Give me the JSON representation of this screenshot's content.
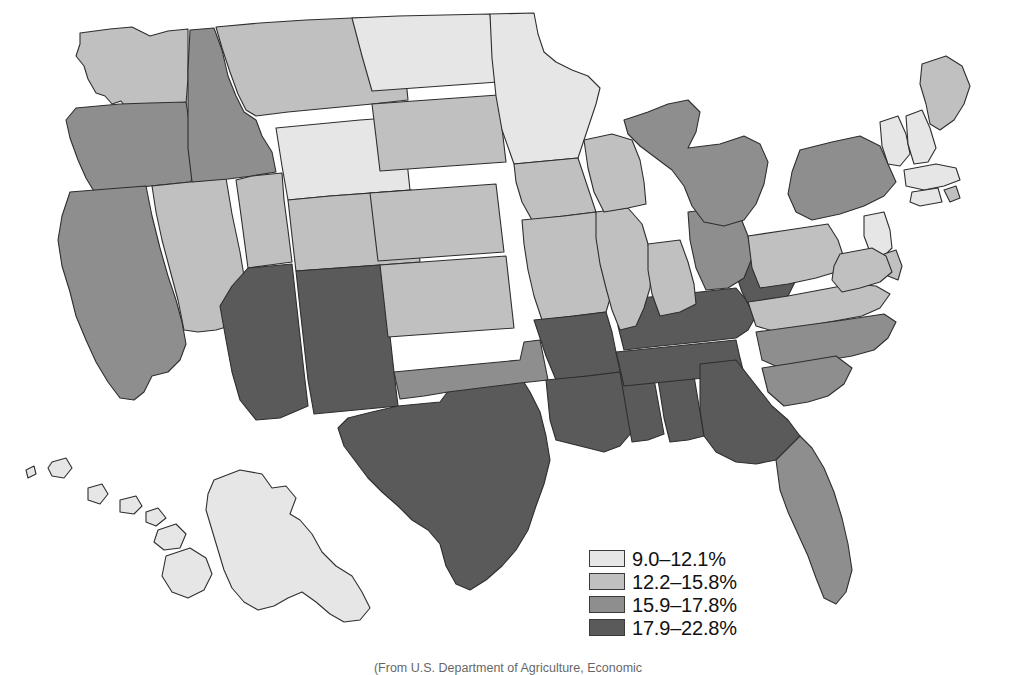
{
  "figure": {
    "type": "choropleth-map",
    "region": "United States",
    "caption_partial": "(From U.S. Department of Agriculture, Economic",
    "border_color": "#2e2e2e",
    "background": "#ffffff"
  },
  "legend": {
    "name": "map-legend",
    "position": "bottom-center",
    "items": [
      {
        "label": "9.0–12.1%",
        "color": "#e6e6e6",
        "min": 9.0,
        "max": 12.1
      },
      {
        "label": "12.2–15.8%",
        "color": "#c0c0c0",
        "min": 12.2,
        "max": 15.8
      },
      {
        "label": "15.9–17.8%",
        "color": "#8e8e8e",
        "min": 15.9,
        "max": 17.8
      },
      {
        "label": "17.9–22.8%",
        "color": "#5a5a5a",
        "min": 17.9,
        "max": 22.8
      }
    ]
  },
  "chart_data": {
    "type": "heatmap",
    "title": "",
    "xlabel": "",
    "ylabel": "",
    "value_unit": "%",
    "classes": [
      "9.0–12.1%",
      "12.2–15.8%",
      "15.9–17.8%",
      "17.9–22.8%"
    ],
    "class_colors": [
      "#e6e6e6",
      "#c0c0c0",
      "#8e8e8e",
      "#5a5a5a"
    ],
    "legend_position": "bottom-center",
    "grid": false,
    "regions": [
      {
        "code": "WA",
        "name": "Washington",
        "class": 1
      },
      {
        "code": "OR",
        "name": "Oregon",
        "class": 2
      },
      {
        "code": "CA",
        "name": "California",
        "class": 2
      },
      {
        "code": "ID",
        "name": "Idaho",
        "class": 2
      },
      {
        "code": "NV",
        "name": "Nevada",
        "class": 1
      },
      {
        "code": "MT",
        "name": "Montana",
        "class": 1
      },
      {
        "code": "WY",
        "name": "Wyoming",
        "class": 0
      },
      {
        "code": "UT",
        "name": "Utah",
        "class": 1
      },
      {
        "code": "CO",
        "name": "Colorado",
        "class": 1
      },
      {
        "code": "AZ",
        "name": "Arizona",
        "class": 3
      },
      {
        "code": "NM",
        "name": "New Mexico",
        "class": 3
      },
      {
        "code": "TX",
        "name": "Texas",
        "class": 3
      },
      {
        "code": "OK",
        "name": "Oklahoma",
        "class": 2
      },
      {
        "code": "KS",
        "name": "Kansas",
        "class": 1
      },
      {
        "code": "NE",
        "name": "Nebraska",
        "class": 1
      },
      {
        "code": "SD",
        "name": "South Dakota",
        "class": 1
      },
      {
        "code": "ND",
        "name": "North Dakota",
        "class": 0
      },
      {
        "code": "MN",
        "name": "Minnesota",
        "class": 0
      },
      {
        "code": "IA",
        "name": "Iowa",
        "class": 1
      },
      {
        "code": "MO",
        "name": "Missouri",
        "class": 1
      },
      {
        "code": "AR",
        "name": "Arkansas",
        "class": 3
      },
      {
        "code": "LA",
        "name": "Louisiana",
        "class": 3
      },
      {
        "code": "MS",
        "name": "Mississippi",
        "class": 3
      },
      {
        "code": "AL",
        "name": "Alabama",
        "class": 3
      },
      {
        "code": "TN",
        "name": "Tennessee",
        "class": 3
      },
      {
        "code": "KY",
        "name": "Kentucky",
        "class": 3
      },
      {
        "code": "WV",
        "name": "West Virginia",
        "class": 3
      },
      {
        "code": "VA",
        "name": "Virginia",
        "class": 1
      },
      {
        "code": "NC",
        "name": "North Carolina",
        "class": 2
      },
      {
        "code": "SC",
        "name": "South Carolina",
        "class": 2
      },
      {
        "code": "GA",
        "name": "Georgia",
        "class": 3
      },
      {
        "code": "FL",
        "name": "Florida",
        "class": 2
      },
      {
        "code": "IL",
        "name": "Illinois",
        "class": 1
      },
      {
        "code": "IN",
        "name": "Indiana",
        "class": 1
      },
      {
        "code": "OH",
        "name": "Ohio",
        "class": 2
      },
      {
        "code": "MI",
        "name": "Michigan",
        "class": 2
      },
      {
        "code": "WI",
        "name": "Wisconsin",
        "class": 1
      },
      {
        "code": "PA",
        "name": "Pennsylvania",
        "class": 1
      },
      {
        "code": "NY",
        "name": "New York",
        "class": 2
      },
      {
        "code": "VT",
        "name": "Vermont",
        "class": 0
      },
      {
        "code": "NH",
        "name": "New Hampshire",
        "class": 0
      },
      {
        "code": "ME",
        "name": "Maine",
        "class": 1
      },
      {
        "code": "MA",
        "name": "Massachusetts",
        "class": 0
      },
      {
        "code": "RI",
        "name": "Rhode Island",
        "class": 1
      },
      {
        "code": "CT",
        "name": "Connecticut",
        "class": 0
      },
      {
        "code": "NJ",
        "name": "New Jersey",
        "class": 0
      },
      {
        "code": "DE",
        "name": "Delaware",
        "class": 1
      },
      {
        "code": "MD",
        "name": "Maryland",
        "class": 1
      },
      {
        "code": "AK",
        "name": "Alaska",
        "class": 0
      },
      {
        "code": "HI",
        "name": "Hawaii",
        "class": 0
      }
    ]
  }
}
